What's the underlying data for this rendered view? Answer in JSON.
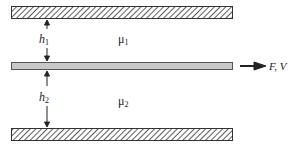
{
  "diagram": {
    "top_gap_label": "h",
    "top_gap_sub": "1",
    "bottom_gap_label": "h",
    "bottom_gap_sub": "2",
    "top_fluid_label": "μ",
    "top_fluid_sub": "1",
    "bottom_fluid_label": "μ",
    "bottom_fluid_sub": "2",
    "force_label": "F, V",
    "colors": {
      "plate": "#c8c8c8",
      "hatch": "#333333",
      "line": "#222222"
    }
  }
}
